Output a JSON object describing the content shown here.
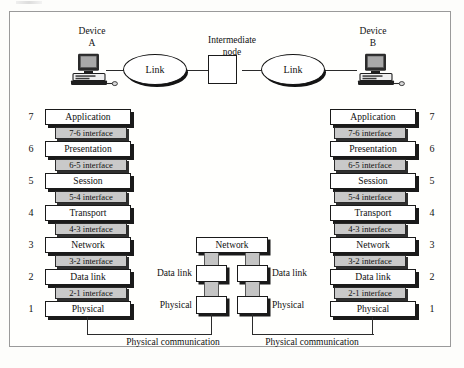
{
  "figure": {
    "devices": [
      {
        "name": "device-a",
        "line1": "Device",
        "line2": "A"
      },
      {
        "name": "device-b",
        "line1": "Device",
        "line2": "B"
      }
    ],
    "intermediate_node": {
      "line1": "Intermediate",
      "line2": "node"
    },
    "links": [
      "Link",
      "Link"
    ],
    "layers": [
      {
        "number": "7",
        "label": "Application"
      },
      {
        "number": "6",
        "label": "Presentation"
      },
      {
        "number": "5",
        "label": "Session"
      },
      {
        "number": "4",
        "label": "Transport"
      },
      {
        "number": "3",
        "label": "Network"
      },
      {
        "number": "2",
        "label": "Data link"
      },
      {
        "number": "1",
        "label": "Physical"
      }
    ],
    "interfaces": [
      "7-6 interface",
      "6-5 interface",
      "5-4 interface",
      "4-3 interface",
      "3-2 interface",
      "2-1 interface"
    ],
    "middle_node": {
      "network": "Network",
      "left_labels": [
        "Data link",
        "Physical"
      ],
      "right_labels": [
        "Data link",
        "Physical"
      ]
    },
    "physical_communication": [
      "Physical communication",
      "Physical communication"
    ],
    "colors": {
      "frame": "#9a9a9a",
      "box_fill": "#ffffff",
      "box_border": "#1a1a1a",
      "interface_fill": "#c9c9c9",
      "shadow": "#1a1a1a",
      "wire": "#2b2b2b"
    }
  }
}
